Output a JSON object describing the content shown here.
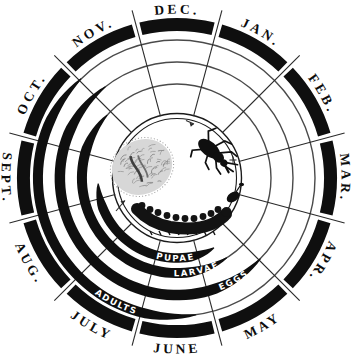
{
  "diagram": {
    "type": "circular-insect-life-cycle-calendar",
    "months": [
      {
        "label": "DEC.",
        "angle": 0,
        "flipped": false
      },
      {
        "label": "JAN.",
        "angle": 30,
        "flipped": false
      },
      {
        "label": "FEB.",
        "angle": 60,
        "flipped": false
      },
      {
        "label": "MAR.",
        "angle": 90,
        "flipped": false
      },
      {
        "label": "APR.",
        "angle": 120,
        "flipped": false
      },
      {
        "label": "MAY",
        "angle": 150,
        "flipped": true
      },
      {
        "label": "JUNE",
        "angle": 180,
        "flipped": true
      },
      {
        "label": "JULY",
        "angle": 210,
        "flipped": true
      },
      {
        "label": "AUG.",
        "angle": 240,
        "flipped": true
      },
      {
        "label": "SEPT.",
        "angle": 270,
        "flipped": true
      },
      {
        "label": "OCT.",
        "angle": 300,
        "flipped": false
      },
      {
        "label": "NOV.",
        "angle": 330,
        "flipped": false
      }
    ],
    "stages": [
      {
        "label": "ADULTS",
        "radius": 138,
        "full_ring": true,
        "band_start": 172,
        "band_end": 316,
        "max_width": 9,
        "label_angle": 206
      },
      {
        "label": "EGGS",
        "radius": 116,
        "full_ring": true,
        "band_start": 134,
        "band_end": 322,
        "max_width": 9.5,
        "label_angle": 151
      },
      {
        "label": "LARVAE",
        "radius": 94,
        "full_ring": true,
        "band_start": 148,
        "band_end": 312,
        "max_width": 9,
        "label_angle": 168
      },
      {
        "label": "PUPAE",
        "radius": 79,
        "full_ring": false,
        "band_start": 152,
        "band_end": 266,
        "max_width": 8.5,
        "label_angle": 181
      }
    ],
    "center_illustrations": [
      {
        "name": "egg-mass"
      },
      {
        "name": "adult-insect"
      },
      {
        "name": "larva"
      },
      {
        "name": "pupa"
      }
    ],
    "geometry": {
      "cx": 177,
      "cy": 178,
      "band_radius": 153.5,
      "band_thickness": 13,
      "month_gap_deg": 1.4,
      "divider_inner": 64,
      "divider_outer": 173.5,
      "label_radius": 164.5,
      "label_radius_flipped": 175.5,
      "stage_label_offset": 4.2,
      "center_circle_radii": [
        59.5,
        64.5
      ]
    },
    "colors": {
      "ink": "#0f0f0f",
      "thin_ring": "#4a4a4a",
      "divider": "#2a2a2a",
      "paper": "#ffffff",
      "band_text": "#ffffff",
      "egg_mass_base": "#d7d7d7",
      "egg_mass_scribble": "#9a9a9a",
      "egg_mass_core": "#3f3f3f"
    }
  }
}
